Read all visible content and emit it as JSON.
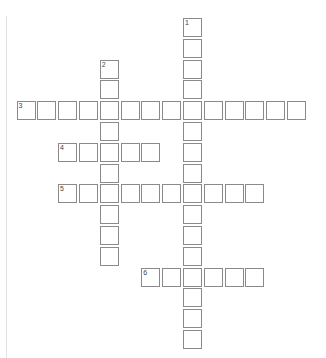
{
  "puzzle": {
    "cell_size": 20.8,
    "origin_x": 16.5,
    "origin_y": 18,
    "colors": {
      "cell_border": "#8a8a8a",
      "cell_fill": "#ffffff",
      "number": "#444444"
    },
    "entries": [
      {
        "number": "1",
        "direction": "down",
        "row": 0,
        "col": 8,
        "length": 16
      },
      {
        "number": "2",
        "direction": "down",
        "row": 2,
        "col": 4,
        "length": 10
      },
      {
        "number": "3",
        "direction": "across",
        "row": 4,
        "col": 0,
        "length": 14
      },
      {
        "number": "4",
        "direction": "across",
        "row": 6,
        "col": 2,
        "length": 5
      },
      {
        "number": "5",
        "direction": "across",
        "row": 8,
        "col": 2,
        "length": 10
      },
      {
        "number": "6",
        "direction": "across",
        "row": 12,
        "col": 6,
        "length": 6
      }
    ]
  }
}
